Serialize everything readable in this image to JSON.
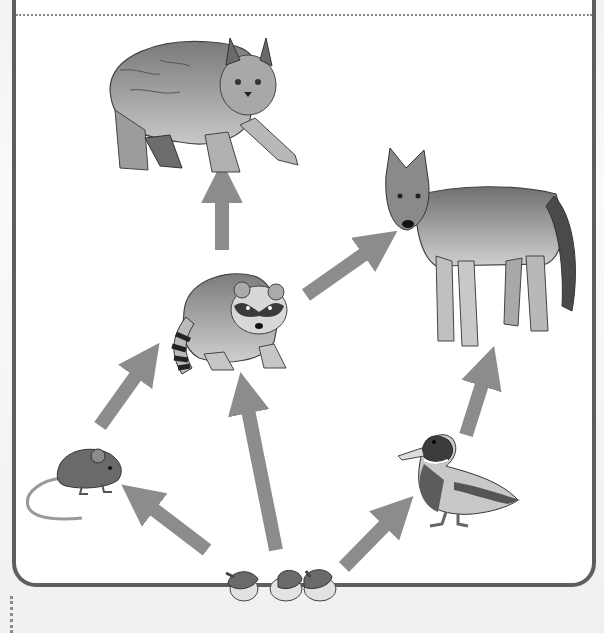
{
  "diagram": {
    "type": "food-web",
    "arrow_color": "#8c8c8c",
    "frame_border_color": "#5e5e5e",
    "organisms": [
      {
        "id": "lynx",
        "name": "Lynx",
        "role": "top predator"
      },
      {
        "id": "coyote",
        "name": "Coyote",
        "role": "top predator"
      },
      {
        "id": "raccoon",
        "name": "Raccoon",
        "role": "consumer"
      },
      {
        "id": "mouse",
        "name": "Mouse",
        "role": "primary consumer"
      },
      {
        "id": "duck",
        "name": "Mallard duck",
        "role": "primary consumer"
      },
      {
        "id": "acorns",
        "name": "Acorns",
        "role": "producer"
      }
    ],
    "arrows": [
      {
        "from": "acorns",
        "to": "mouse"
      },
      {
        "from": "acorns",
        "to": "raccoon"
      },
      {
        "from": "acorns",
        "to": "duck"
      },
      {
        "from": "mouse",
        "to": "raccoon"
      },
      {
        "from": "raccoon",
        "to": "lynx"
      },
      {
        "from": "raccoon",
        "to": "coyote"
      },
      {
        "from": "duck",
        "to": "coyote"
      }
    ]
  }
}
